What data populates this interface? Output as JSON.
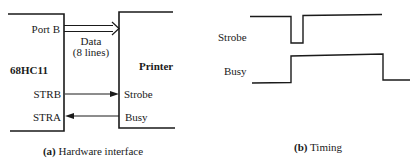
{
  "panel_a": {
    "mcu_label": "68HC11",
    "device_label": "Printer",
    "port_label": "Port B",
    "data_label_line1": "Data",
    "data_label_line2": "(8 lines)",
    "mcu_pins": [
      "STRB",
      "STRA"
    ],
    "device_pins": [
      "Strobe",
      "Busy"
    ],
    "caption_prefix": "(a)",
    "caption_text": " Hardware interface"
  },
  "panel_b": {
    "signals": [
      {
        "name": "Strobe"
      },
      {
        "name": "Busy"
      }
    ],
    "caption_prefix": "(b)",
    "caption_text": " Timing"
  }
}
